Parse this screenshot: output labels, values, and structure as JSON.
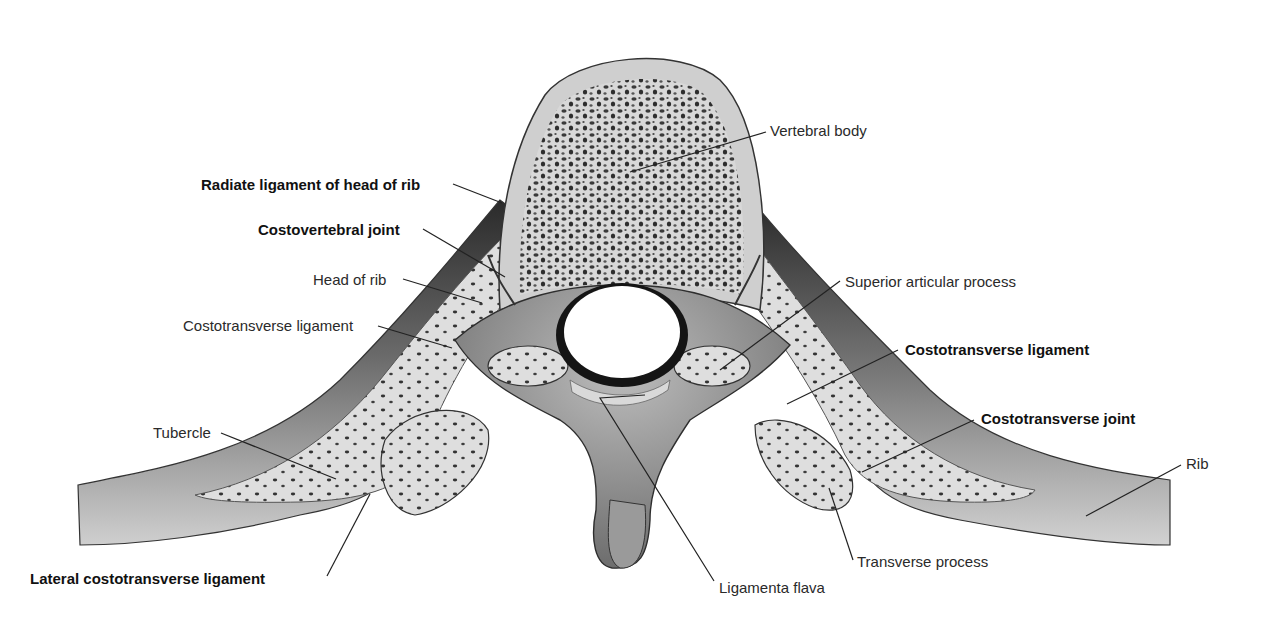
{
  "figure": {
    "colors": {
      "background": "#ffffff",
      "bone_cortex": "#cfcfcf",
      "bone_light": "#e4e4e4",
      "trabecular_dark": "#3a3a3a",
      "shadow": "#4a4a4a",
      "leader_line": "#222222",
      "label_text": "#2a2a2a"
    }
  },
  "labels": [
    {
      "id": "vertebral-body",
      "text": "Vertebral body",
      "bold": false,
      "x": 770,
      "y": 122,
      "line": [
        [
          766,
          132
        ],
        [
          630,
          172
        ]
      ]
    },
    {
      "id": "radiate-ligament",
      "text": "Radiate ligament of head of rib",
      "bold": true,
      "x": 201,
      "y": 176,
      "line": [
        [
          453,
          184
        ],
        [
          502,
          203
        ]
      ]
    },
    {
      "id": "costovertebral-joint",
      "text": "Costovertebral joint",
      "bold": true,
      "x": 258,
      "y": 221,
      "line": [
        [
          423,
          229
        ],
        [
          505,
          277
        ]
      ]
    },
    {
      "id": "head-of-rib",
      "text": "Head of rib",
      "bold": false,
      "x": 313,
      "y": 271,
      "line": [
        [
          403,
          279
        ],
        [
          482,
          303
        ]
      ]
    },
    {
      "id": "costotransverse-ligament-left",
      "text": "Costotransverse ligament",
      "bold": false,
      "x": 183,
      "y": 317,
      "line": [
        [
          378,
          326
        ],
        [
          452,
          348
        ]
      ]
    },
    {
      "id": "superior-articular-process",
      "text": "Superior articular process",
      "bold": false,
      "x": 845,
      "y": 273,
      "line": [
        [
          840,
          281
        ],
        [
          720,
          370
        ]
      ]
    },
    {
      "id": "costotransverse-ligament-right",
      "text": "Costotransverse ligament",
      "bold": true,
      "x": 905,
      "y": 341,
      "line": [
        [
          898,
          350
        ],
        [
          787,
          404
        ]
      ]
    },
    {
      "id": "costotransverse-joint",
      "text": "Costotransverse joint",
      "bold": true,
      "x": 981,
      "y": 410,
      "line": [
        [
          974,
          420
        ],
        [
          862,
          472
        ]
      ]
    },
    {
      "id": "tubercle",
      "text": "Tubercle",
      "bold": false,
      "x": 153,
      "y": 424,
      "line": [
        [
          221,
          433
        ],
        [
          336,
          479
        ]
      ]
    },
    {
      "id": "rib",
      "text": "Rib",
      "bold": false,
      "x": 1186,
      "y": 455,
      "line": [
        [
          1181,
          465
        ],
        [
          1086,
          516
        ]
      ]
    },
    {
      "id": "lateral-costotransverse-ligament",
      "text": "Lateral costotransverse ligament",
      "bold": true,
      "x": 30,
      "y": 570,
      "line": [
        [
          327,
          576
        ],
        [
          370,
          494
        ]
      ]
    },
    {
      "id": "transverse-process",
      "text": "Transverse process",
      "bold": false,
      "x": 857,
      "y": 553,
      "line": [
        [
          853,
          560
        ],
        [
          829,
          488
        ]
      ]
    },
    {
      "id": "ligamenta-flava",
      "text": "Ligamenta flava",
      "bold": false,
      "x": 719,
      "y": 579,
      "line": [
        [
          714,
          581
        ],
        [
          600,
          398
        ],
        [
          645,
          395
        ]
      ]
    }
  ]
}
